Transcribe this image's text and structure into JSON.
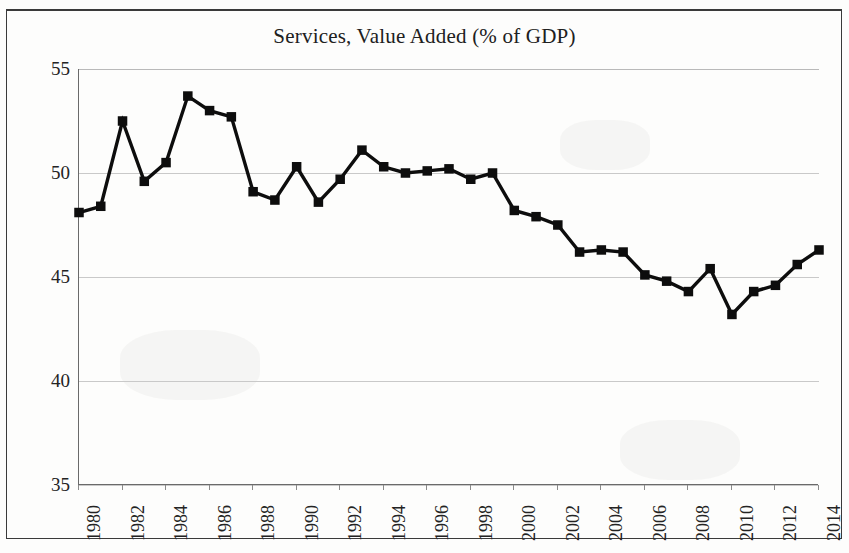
{
  "figure": {
    "title": "Services,  Value Added (% of GDP)"
  },
  "axes": {
    "y_tick_labels": [
      "55",
      "50",
      "45",
      "40",
      "35"
    ],
    "x_tick_labels": [
      "1980",
      "1982",
      "1984",
      "1986",
      "1988",
      "1990",
      "1992",
      "1994",
      "1996",
      "1998",
      "2000",
      "2002",
      "2004",
      "2006",
      "2008",
      "2010",
      "2012",
      "2014"
    ]
  },
  "chart_data": {
    "type": "line",
    "title": "Services,  Value Added (% of GDP)",
    "xlabel": "",
    "ylabel": "",
    "xlim": [
      1980,
      2014
    ],
    "ylim": [
      35,
      55
    ],
    "yticks": [
      35,
      40,
      45,
      50,
      55
    ],
    "xticks": [
      1980,
      1982,
      1984,
      1986,
      1988,
      1990,
      1992,
      1994,
      1996,
      1998,
      2000,
      2002,
      2004,
      2006,
      2008,
      2010,
      2012,
      2014
    ],
    "grid": true,
    "legend": null,
    "marker": "square",
    "line_color": "#0d0d0d",
    "marker_color": "#0d0d0d",
    "x": [
      1980,
      1981,
      1982,
      1983,
      1984,
      1985,
      1986,
      1987,
      1988,
      1989,
      1990,
      1991,
      1992,
      1993,
      1994,
      1995,
      1996,
      1997,
      1998,
      1999,
      2000,
      2001,
      2002,
      2003,
      2004,
      2005,
      2006,
      2007,
      2008,
      2009,
      2010,
      2011,
      2012,
      2013,
      2014
    ],
    "values": [
      48.1,
      48.4,
      52.5,
      49.6,
      50.5,
      53.7,
      53.0,
      52.7,
      49.1,
      48.7,
      50.3,
      48.6,
      49.7,
      51.1,
      50.3,
      50.0,
      50.1,
      50.2,
      49.7,
      50.0,
      48.2,
      47.9,
      47.5,
      46.2,
      46.3,
      46.2,
      45.1,
      44.8,
      44.3,
      45.4,
      43.2,
      44.3,
      44.6,
      45.6,
      46.3
    ],
    "series": [
      {
        "name": "Services, value added (% of GDP)",
        "values": [
          48.1,
          48.4,
          52.5,
          49.6,
          50.5,
          53.7,
          53.0,
          52.7,
          49.1,
          48.7,
          50.3,
          48.6,
          49.7,
          51.1,
          50.3,
          50.0,
          50.1,
          50.2,
          49.7,
          50.0,
          48.2,
          47.9,
          47.5,
          46.2,
          46.3,
          46.2,
          45.1,
          44.8,
          44.3,
          45.4,
          43.2,
          44.3,
          44.6,
          45.6,
          46.3
        ]
      }
    ]
  }
}
